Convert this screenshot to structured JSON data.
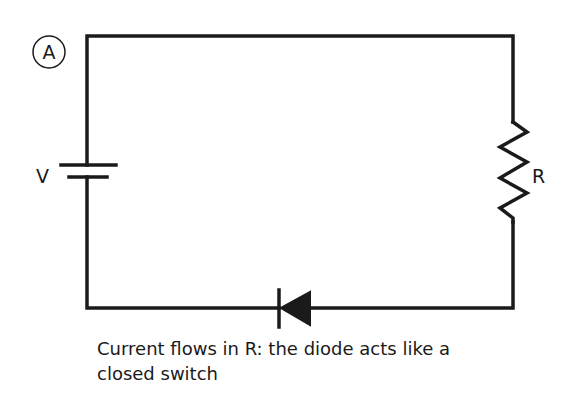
{
  "diagram": {
    "panel_label": "A",
    "battery_label": "V",
    "resistor_label": "R",
    "caption_line1": "Current flows in R: the diode acts like a",
    "caption_line2": "closed switch",
    "colors": {
      "stroke": "#1a1a1a",
      "background": "#ffffff"
    }
  }
}
